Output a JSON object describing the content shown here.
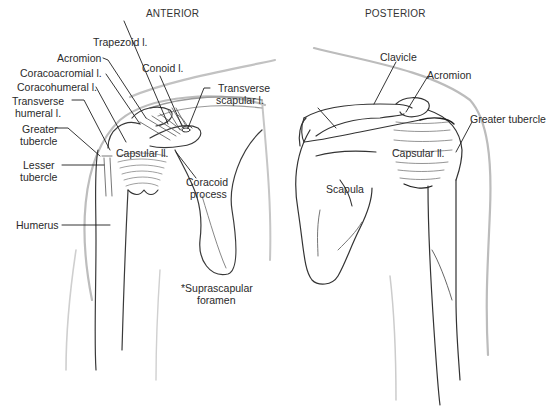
{
  "figure": {
    "views": [
      {
        "id": "anterior",
        "title": "ANTERIOR"
      },
      {
        "id": "posterior",
        "title": "POSTERIOR"
      }
    ]
  },
  "anterior": {
    "title": "ANTERIOR",
    "labels": {
      "trapezoid": "Trapezoid l.",
      "acromion": "Acromion",
      "coracoacromial": "Coracoacromial l.",
      "coracohumeral": "Coracohumeral l.",
      "transverse_humeral_1": "Transverse",
      "transverse_humeral_2": "humeral l.",
      "greater_tubercle_1": "Greater",
      "greater_tubercle_2": "tubercle",
      "lesser_tubercle_1": "Lesser",
      "lesser_tubercle_2": "tubercle",
      "humerus": "Humerus",
      "conoid": "Conoid l.",
      "transverse_scapular_1": "Transverse",
      "transverse_scapular_2": "scapular l.",
      "capsular": "Capsular ll.",
      "coracoid_1": "Coracoid",
      "coracoid_2": "process",
      "suprascapular_1": "*Suprascapular",
      "suprascapular_2": "foramen"
    }
  },
  "posterior": {
    "title": "POSTERIOR",
    "labels": {
      "clavicle": "Clavicle",
      "acromion": "Acromion",
      "greater_tubercle": "Greater tubercle",
      "capsular": "Capsular ll.",
      "scapula": "Scapula"
    }
  },
  "colors": {
    "line": "#2b2b2b",
    "outline_faint": "#b5b5b5",
    "text": "#2a2a2a",
    "background": "#ffffff"
  }
}
